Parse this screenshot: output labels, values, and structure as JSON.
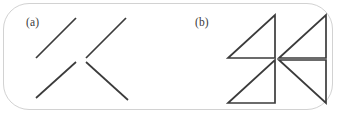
{
  "figure": {
    "width": 342,
    "height": 119,
    "background_color": "#ffffff",
    "frame": {
      "border_color": "#d2d2d2",
      "corner_radius": 26
    },
    "stroke_color": "#3b3b3b",
    "stroke_width": 1.7
  },
  "panels": [
    {
      "id": "a",
      "label": "(a)",
      "content_type": "line-segments",
      "description": "four oblique line segments",
      "items": [
        {
          "name": "segment-top-left",
          "orientation": "positive-slope",
          "x1": 26,
          "y1": 58,
          "x2": 66,
          "y2": 18
        },
        {
          "name": "segment-top-right",
          "orientation": "positive-slope",
          "x1": 76,
          "y1": 58,
          "x2": 116,
          "y2": 18
        },
        {
          "name": "segment-bottom-left",
          "orientation": "positive-slope",
          "x1": 26,
          "y1": 98,
          "x2": 66,
          "y2": 62
        },
        {
          "name": "segment-bottom-right",
          "orientation": "negative-slope",
          "x1": 76,
          "y1": 62,
          "x2": 118,
          "y2": 100
        }
      ]
    },
    {
      "id": "b",
      "label": "(b)",
      "content_type": "right-triangles",
      "description": "four right triangles in a two-by-two arrangement",
      "items": [
        {
          "name": "triangle-top-left",
          "orientation": "hypotenuse-bottom-left-to-top-right",
          "points": "48,58 95,58 95,15"
        },
        {
          "name": "triangle-top-right",
          "orientation": "hypotenuse-bottom-left-to-top-right",
          "points": "99,58 146,58 146,15"
        },
        {
          "name": "triangle-bottom-left",
          "orientation": "hypotenuse-bottom-left-to-top-right",
          "points": "48,103 95,103 95,60"
        },
        {
          "name": "triangle-bottom-right",
          "orientation": "hypotenuse-top-left-to-bottom-right",
          "points": "99,60 146,103 146,60"
        }
      ]
    }
  ]
}
